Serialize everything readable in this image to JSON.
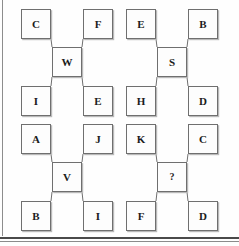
{
  "figure": {
    "kind": "letter-analogy-puzzle",
    "layout": "2x2 grid of five-box clusters",
    "border_color": "#6f6f6f",
    "text_color": "#1b1b1b",
    "background_color": "#fefefe",
    "rule_color": "#4a4a4a"
  },
  "groups": [
    {
      "name": "group-top-left",
      "top_left": "C",
      "top_right": "F",
      "center": "W",
      "bottom_left": "I",
      "bottom_right": "E"
    },
    {
      "name": "group-top-right",
      "top_left": "E",
      "top_right": "B",
      "center": "S",
      "bottom_left": "H",
      "bottom_right": "D"
    },
    {
      "name": "group-bottom-left",
      "top_left": "A",
      "top_right": "J",
      "center": "V",
      "bottom_left": "B",
      "bottom_right": "I"
    },
    {
      "name": "group-bottom-right",
      "top_left": "K",
      "top_right": "C",
      "center": "?",
      "bottom_left": "F",
      "bottom_right": "D"
    }
  ]
}
